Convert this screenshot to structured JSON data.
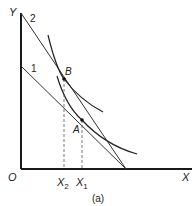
{
  "figure": {
    "caption": "(a)",
    "axes": {
      "origin_label": "O",
      "x_label": "X",
      "y_label": "Y"
    },
    "budget_lines": [
      {
        "label": "1"
      },
      {
        "label": "2"
      }
    ],
    "points": [
      {
        "label": "A"
      },
      {
        "label": "B"
      }
    ],
    "x_ticks": [
      {
        "base": "X",
        "sub": "2"
      },
      {
        "base": "X",
        "sub": "1"
      }
    ],
    "colors": {
      "axis": "#1a1a1a",
      "line": "#333333",
      "curve": "#222222",
      "dashed": "#555555"
    }
  }
}
